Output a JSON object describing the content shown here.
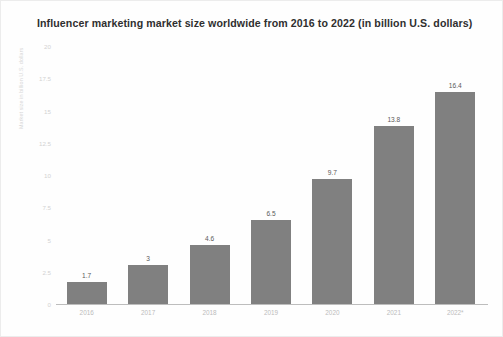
{
  "chart_data": {
    "type": "bar",
    "title": "Influencer marketing market size worldwide from 2016 to 2022 (in billion U.S. dollars)",
    "xlabel": "",
    "ylabel": "Market size in billion U.S. dollars",
    "categories": [
      "2016",
      "2017",
      "2018",
      "2019",
      "2020",
      "2021",
      "2022*"
    ],
    "values": [
      1.7,
      3,
      4.6,
      6.5,
      9.7,
      13.8,
      16.4
    ],
    "value_labels": [
      "1.7",
      "3",
      "4.6",
      "6.5",
      "9.7",
      "13.8",
      "16.4"
    ],
    "ylim": [
      0,
      20
    ],
    "yticks": [
      0,
      2.5,
      5,
      7.5,
      10,
      12.5,
      15,
      17.5,
      20
    ],
    "ytick_labels": [
      "0",
      "2.5",
      "5",
      "7.5",
      "10",
      "12.5",
      "15",
      "17.5",
      "20"
    ],
    "grid": false,
    "legend": null,
    "bar_color": "#808080",
    "background_color": "#ffffff"
  }
}
